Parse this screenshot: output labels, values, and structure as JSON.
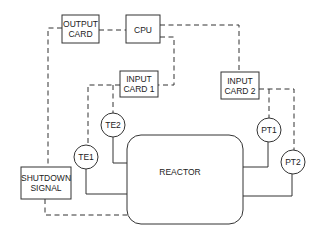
{
  "diagram": {
    "type": "block-diagram",
    "title": "",
    "nodes": {
      "output_card": {
        "line1": "OUTPUT",
        "line2": "CARD"
      },
      "cpu": {
        "label": "CPU"
      },
      "input_card_1": {
        "line1": "INPUT",
        "line2": "CARD 1"
      },
      "input_card_2": {
        "line1": "INPUT",
        "line2": "CARD 2"
      },
      "te1": {
        "label": "TE1"
      },
      "te2": {
        "label": "TE2"
      },
      "pt1": {
        "label": "PT1"
      },
      "pt2": {
        "label": "PT2"
      },
      "reactor": {
        "label": "REACTOR"
      },
      "shutdown_signal": {
        "line1": "SHUTDOWN",
        "line2": "SIGNAL"
      }
    },
    "edges": [
      {
        "from": "CPU",
        "to": "OUTPUT CARD",
        "style": "dashed"
      },
      {
        "from": "INPUT CARD 1",
        "to": "CPU",
        "style": "dashed"
      },
      {
        "from": "INPUT CARD 2",
        "to": "CPU",
        "style": "dashed"
      },
      {
        "from": "TE1",
        "to": "INPUT CARD 1",
        "style": "dashed"
      },
      {
        "from": "TE2",
        "to": "INPUT CARD 1",
        "style": "dashed"
      },
      {
        "from": "PT1",
        "to": "INPUT CARD 2",
        "style": "dashed"
      },
      {
        "from": "PT2",
        "to": "INPUT CARD 2",
        "style": "dashed"
      },
      {
        "from": "REACTOR",
        "to": "TE1",
        "style": "solid"
      },
      {
        "from": "REACTOR",
        "to": "TE2",
        "style": "solid"
      },
      {
        "from": "REACTOR",
        "to": "PT1",
        "style": "solid"
      },
      {
        "from": "REACTOR",
        "to": "PT2",
        "style": "solid"
      },
      {
        "from": "OUTPUT CARD",
        "to": "SHUTDOWN SIGNAL",
        "style": "dashed"
      },
      {
        "from": "SHUTDOWN SIGNAL",
        "to": "REACTOR",
        "style": "dashed"
      }
    ]
  }
}
